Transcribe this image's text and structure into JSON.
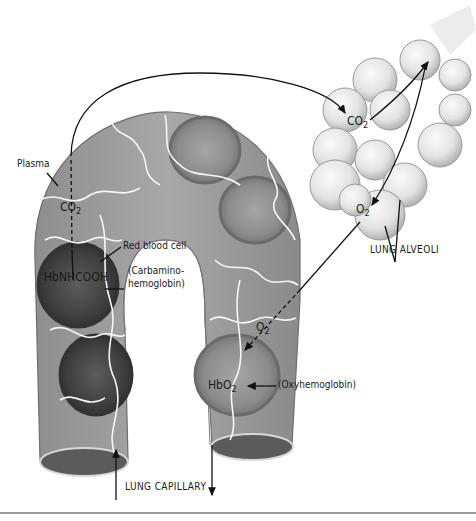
{
  "diagram": {
    "type": "illustration",
    "labels": {
      "plasma": "Plasma",
      "co2_capillary": "CO",
      "co2_capillary_sub": "2",
      "red_blood_cell": "Red blood cell",
      "carbamino_formula": "HbNHCOOH",
      "carbamino_name_line1": "(Carbamino-",
      "carbamino_name_line2": "hemoglobin)",
      "co2_alveoli": "CO",
      "co2_alveoli_sub": "2",
      "o2_alveoli": "O",
      "o2_alveoli_sub": "2",
      "lung_alveoli": "LUNG ALVEOLI",
      "o2_capillary": "O",
      "o2_capillary_sub": "2",
      "oxy_formula": "HbO",
      "oxy_formula_sub": "2",
      "oxy_name": "(Oxyhemoglobin)",
      "lung_capillary": "LUNG CAPILLARY"
    },
    "colors": {
      "vessel": "#9c9c9c",
      "vessel_dark": "#7a7a7a",
      "rbc_dark": "#4a4a4a",
      "rbc_light": "#8a8a8a",
      "alveoli": "#e6e6e6",
      "alveoli_shade": "#b5b5b5",
      "arrow": "#111111"
    }
  }
}
